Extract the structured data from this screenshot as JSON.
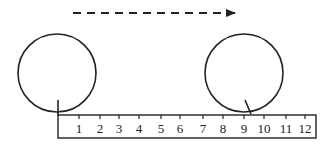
{
  "diagram": {
    "colors": {
      "stroke": "#222222",
      "background": "#ffffff"
    },
    "arrow": {
      "x1": 73,
      "y1": 13,
      "x2": 237,
      "y2": 13,
      "style": "dashed",
      "direction": "right"
    },
    "circles": [
      {
        "id": "start",
        "cx": 57,
        "cy": 73,
        "r": 39,
        "marker": {
          "x1": 58,
          "y1": 100,
          "x2": 58,
          "y2": 116
        }
      },
      {
        "id": "end",
        "cx": 244,
        "cy": 73,
        "r": 39,
        "marker": {
          "x1": 245,
          "y1": 100,
          "x2": 251,
          "y2": 114
        }
      }
    ],
    "ruler": {
      "x": 58,
      "y": 115,
      "width": 258,
      "height": 23,
      "ticks": [
        {
          "label": "1",
          "x": 79
        },
        {
          "label": "2",
          "x": 100
        },
        {
          "label": "3",
          "x": 119
        },
        {
          "label": "4",
          "x": 139
        },
        {
          "label": "5",
          "x": 161
        },
        {
          "label": "6",
          "x": 180
        },
        {
          "label": "7",
          "x": 203
        },
        {
          "label": "8",
          "x": 223
        },
        {
          "label": "9",
          "x": 244
        },
        {
          "label": "10",
          "x": 264
        },
        {
          "label": "11",
          "x": 286
        },
        {
          "label": "12",
          "x": 305
        }
      ]
    }
  }
}
